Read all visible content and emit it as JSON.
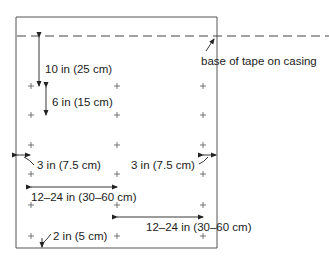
{
  "diagram": {
    "labels": {
      "base_of_tape": "base of tape on casing",
      "first_row_offset": "10 in (25 cm)",
      "row_spacing": "6 in (15 cm)",
      "left_margin": "3 in (7.5 cm)",
      "right_margin": "3 in (7.5 cm)",
      "column_spacing_upper": "12–24 in (30–60 cm)",
      "column_spacing_lower": "12–24 in (30–60 cm)",
      "bottom_offset": "2 in (5 cm)"
    },
    "marker_symbol": "+",
    "grid": {
      "columns": 3,
      "rows": 6
    }
  }
}
